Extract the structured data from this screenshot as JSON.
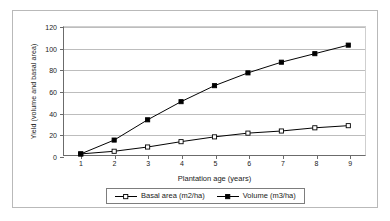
{
  "chart_data": {
    "type": "line",
    "title": "",
    "xlabel": "Plantation age (years)",
    "ylabel": "Yield (volume and basal area)",
    "x": [
      1,
      2,
      3,
      4,
      5,
      6,
      7,
      8,
      9
    ],
    "xticklabels": [
      "1",
      "2",
      "3",
      "4",
      "5",
      "6",
      "7",
      "8",
      "9"
    ],
    "yticklabels": [
      "0",
      "20",
      "40",
      "60",
      "80",
      "100",
      "120"
    ],
    "yticks": [
      0,
      20,
      40,
      60,
      80,
      100,
      120
    ],
    "xlim": [
      0.5,
      9.5
    ],
    "ylim": [
      0,
      120
    ],
    "grid": "horizontal",
    "legend_position": "bottom",
    "series": [
      {
        "name": "Basal area (m2/ha)",
        "values": [
          1,
          3.5,
          7.5,
          12.5,
          17,
          20.5,
          22.5,
          25.5,
          27.5
        ],
        "marker": "open-square",
        "color": "#000000"
      },
      {
        "name": "Volume (m3/ha)",
        "values": [
          1,
          14,
          33,
          50,
          65,
          77,
          87,
          95,
          103
        ],
        "marker": "filled-square",
        "color": "#000000"
      }
    ]
  },
  "legend": {
    "items": [
      {
        "label": "Basal area (m2/ha)",
        "marker": "open-square"
      },
      {
        "label": "Volume (m3/ha)",
        "marker": "filled-square"
      }
    ]
  }
}
